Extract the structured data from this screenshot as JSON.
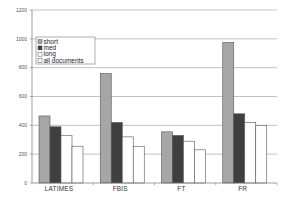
{
  "chart_data": {
    "type": "bar",
    "title": "",
    "xlabel": "",
    "ylabel": "",
    "categories": [
      "LATIMES",
      "FBIS",
      "FT",
      "FR"
    ],
    "series": [
      {
        "name": "short",
        "values": [
          465,
          760,
          355,
          975
        ],
        "color": "#a6a6a6"
      },
      {
        "name": "med",
        "values": [
          390,
          420,
          330,
          480
        ],
        "color": "#3f3f3f"
      },
      {
        "name": "long",
        "values": [
          330,
          320,
          290,
          420
        ],
        "color": "#ffffff"
      },
      {
        "name": "all documents",
        "values": [
          255,
          255,
          230,
          400
        ],
        "color": "#ffffff"
      }
    ],
    "ylim": [
      0,
      1200
    ],
    "yticks": [
      0,
      200,
      400,
      600,
      800,
      1000,
      1200
    ],
    "grid": true,
    "legend_position": "upper left, inside plot"
  }
}
